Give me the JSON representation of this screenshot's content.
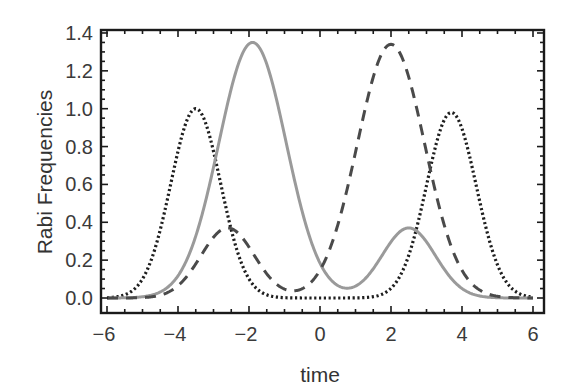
{
  "chart_data": {
    "type": "line",
    "title": "",
    "xlabel": "time",
    "ylabel": "Rabi Frequencies",
    "xlim": [
      -6.35,
      6.3
    ],
    "ylim": [
      -0.08,
      1.42
    ],
    "xticks": [
      -6,
      -4,
      -2,
      0,
      2,
      4,
      6
    ],
    "xtick_labels": [
      "−6",
      "−4",
      "−2",
      "0",
      "2",
      "4",
      "6"
    ],
    "yticks": [
      0.0,
      0.2,
      0.4,
      0.6,
      0.8,
      1.0,
      1.2,
      1.4
    ],
    "ytick_labels": [
      "0.0",
      "0.2",
      "0.4",
      "0.6",
      "0.8",
      "1.0",
      "1.2",
      "1.4"
    ],
    "grid": false,
    "legend": null,
    "x_range": [
      -6,
      6
    ],
    "series": [
      {
        "name": "dotted",
        "style": "dotted",
        "color": "#1e1e1e",
        "width": 3.2,
        "components": [
          {
            "amplitude": 1.0,
            "center": -3.5,
            "sigma": 0.7
          },
          {
            "amplitude": 0.98,
            "center": 3.7,
            "sigma": 0.7
          }
        ],
        "peaks": [
          {
            "x": -3.5,
            "y": 1.0
          },
          {
            "x": 3.7,
            "y": 0.98
          }
        ]
      },
      {
        "name": "solid",
        "style": "solid",
        "color": "#9a9a9a",
        "width": 3.0,
        "components": [
          {
            "amplitude": 1.35,
            "center": -1.9,
            "sigma": 0.95
          },
          {
            "amplitude": 0.37,
            "center": 2.5,
            "sigma": 0.75
          }
        ],
        "peaks": [
          {
            "x": -1.9,
            "y": 1.35
          },
          {
            "x": 2.5,
            "y": 0.37
          }
        ]
      },
      {
        "name": "dashed",
        "style": "dashed",
        "color": "#4a4a4a",
        "width": 3.0,
        "components": [
          {
            "amplitude": 0.37,
            "center": -2.6,
            "sigma": 0.75
          },
          {
            "amplitude": 1.34,
            "center": 2.0,
            "sigma": 0.95
          }
        ],
        "peaks": [
          {
            "x": -2.6,
            "y": 0.37
          },
          {
            "x": 2.0,
            "y": 1.34
          }
        ]
      }
    ]
  },
  "colors": {
    "frame": "#1a1a1a",
    "text": "#333333",
    "background": "#ffffff"
  }
}
